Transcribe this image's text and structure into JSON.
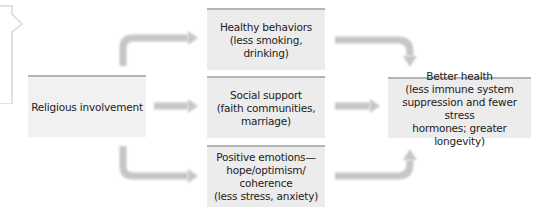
{
  "diagram": {
    "source": {
      "label": "Religious involvement"
    },
    "mediators": [
      {
        "lines": [
          "Healthy behaviors",
          "(less smoking, drinking)"
        ]
      },
      {
        "lines": [
          "Social support",
          "(faith communities,",
          "marriage)"
        ]
      },
      {
        "lines": [
          "Positive emotions—",
          "hope/optimism/",
          "coherence",
          "(less stress, anxiety)"
        ]
      }
    ],
    "outcome": {
      "lines": [
        "Better health",
        "(less immune system",
        "suppression and fewer stress",
        "hormones; greater longevity)"
      ]
    },
    "colors": {
      "box_fill": "#ececec",
      "box_top_border": "#b4b4b4",
      "arrow": "#c6c6c6",
      "text": "#222222"
    }
  }
}
